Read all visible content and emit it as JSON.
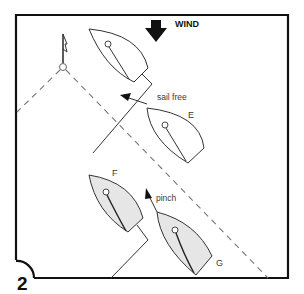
{
  "figure": {
    "number": "2",
    "wind_label": "WIND",
    "annotations": {
      "sail_free": "sail free",
      "pinch": "pinch"
    },
    "boat_labels": {
      "E": "E",
      "F": "F",
      "G": "G"
    },
    "icons": [
      "wind-arrow-icon",
      "mark-flag-icon"
    ],
    "colors": {
      "frame": "#111111",
      "line": "#333333",
      "dashed": "#777777",
      "boat_fill_shaded": "#e6e6e6",
      "boat_fill_plain": "#ffffff"
    }
  }
}
